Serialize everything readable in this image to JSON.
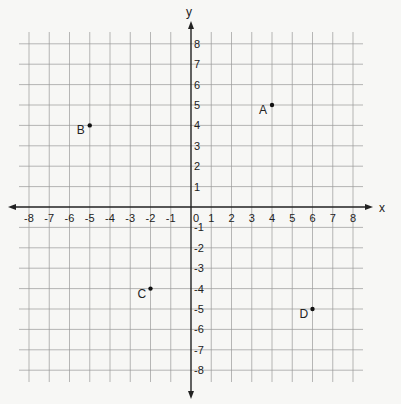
{
  "chart_data": {
    "type": "scatter",
    "title": "",
    "xlabel": "x",
    "ylabel": "y",
    "xlim": [
      -8,
      8
    ],
    "ylim": [
      -8,
      8
    ],
    "grid": true,
    "x_ticks": [
      -8,
      -7,
      -6,
      -5,
      -4,
      -3,
      -2,
      -1,
      0,
      1,
      2,
      3,
      4,
      5,
      6,
      7,
      8
    ],
    "y_ticks": [
      8,
      7,
      6,
      5,
      4,
      3,
      2,
      1,
      -1,
      -2,
      -3,
      -4,
      -5,
      -6,
      -7,
      -8
    ],
    "points": [
      {
        "label": "A",
        "x": 4,
        "y": 5
      },
      {
        "label": "B",
        "x": -5,
        "y": 4
      },
      {
        "label": "C",
        "x": -2,
        "y": -4
      },
      {
        "label": "D",
        "x": 6,
        "y": -5
      }
    ]
  },
  "colors": {
    "background": "#f7f7f5",
    "grid": "#9a9a9a",
    "axis": "#222222",
    "point": "#111111",
    "text": "#222222"
  }
}
